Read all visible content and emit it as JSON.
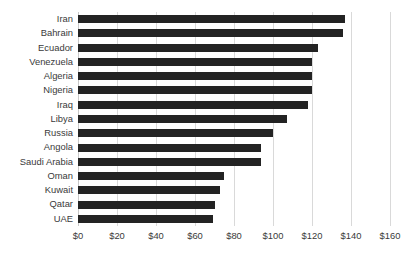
{
  "chart_data": {
    "type": "bar",
    "orientation": "horizontal",
    "title": "",
    "subtitle": "",
    "xlabel": "",
    "ylabel": "",
    "xlim": [
      0,
      160
    ],
    "xtick_step": 20,
    "xtick_labels": [
      "$0",
      "$20",
      "$40",
      "$60",
      "$80",
      "$100",
      "$120",
      "$140",
      "$160"
    ],
    "xtick_values": [
      0,
      20,
      40,
      60,
      80,
      100,
      120,
      140,
      160
    ],
    "grid": "vertical",
    "legend": "none",
    "bar_color": "#232323",
    "gridline_color": "#d9d9d9",
    "categories": [
      "Iran",
      "Bahrain",
      "Ecuador",
      "Venezuela",
      "Algeria",
      "Nigeria",
      "Iraq",
      "Libya",
      "Russia",
      "Angola",
      "Saudi Arabia",
      "Oman",
      "Kuwait",
      "Qatar",
      "UAE"
    ],
    "values": [
      137,
      136,
      123,
      120,
      120,
      120,
      118,
      107,
      100,
      94,
      94,
      75,
      73,
      70,
      69
    ]
  }
}
